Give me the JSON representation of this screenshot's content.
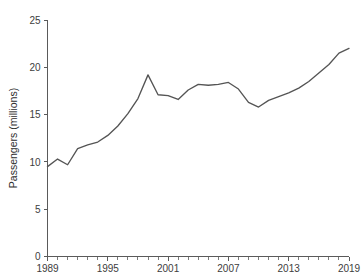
{
  "chart_data": {
    "type": "line",
    "title": "",
    "xlabel": "",
    "ylabel": "Passengers (millions)",
    "xlim": [
      1989,
      2019
    ],
    "ylim": [
      0,
      25
    ],
    "grid": false,
    "legend": "none",
    "y_ticks": [
      0,
      5,
      10,
      15,
      20,
      25
    ],
    "y_tick_labels": [
      "0",
      "5",
      "10",
      "15",
      "20",
      "25"
    ],
    "x_ticks": [
      1989,
      1995,
      2001,
      2007,
      2013,
      2019
    ],
    "x_tick_labels": [
      "1989",
      "1995",
      "2001",
      "2007",
      "2013",
      "2019"
    ],
    "x_minor_tick_interval": 1,
    "line_color": "#555555",
    "axis_color": "#5a5a5a",
    "background_color": "#ffffff",
    "x": [
      1989,
      1990,
      1991,
      1992,
      1993,
      1994,
      1995,
      1996,
      1997,
      1998,
      1999,
      2000,
      2001,
      2002,
      2003,
      2004,
      2005,
      2006,
      2007,
      2008,
      2009,
      2010,
      2011,
      2012,
      2013,
      2014,
      2015,
      2016,
      2017,
      2018,
      2019
    ],
    "values": [
      9.5,
      10.3,
      9.7,
      11.4,
      11.8,
      12.1,
      12.8,
      13.8,
      15.1,
      16.7,
      19.2,
      17.1,
      17.0,
      16.6,
      17.6,
      18.2,
      18.1,
      18.2,
      18.4,
      17.7,
      16.3,
      15.8,
      16.5,
      16.9,
      17.3,
      17.8,
      18.5,
      19.4,
      20.3,
      21.5,
      22.0
    ],
    "series": [
      {
        "name": "Passengers",
        "values": [
          9.5,
          10.3,
          9.7,
          11.4,
          11.8,
          12.1,
          12.8,
          13.8,
          15.1,
          16.7,
          19.2,
          17.1,
          17.0,
          16.6,
          17.6,
          18.2,
          18.1,
          18.2,
          18.4,
          17.7,
          16.3,
          15.8,
          16.5,
          16.9,
          17.3,
          17.8,
          18.5,
          19.4,
          20.3,
          21.5,
          22.0
        ]
      }
    ]
  }
}
